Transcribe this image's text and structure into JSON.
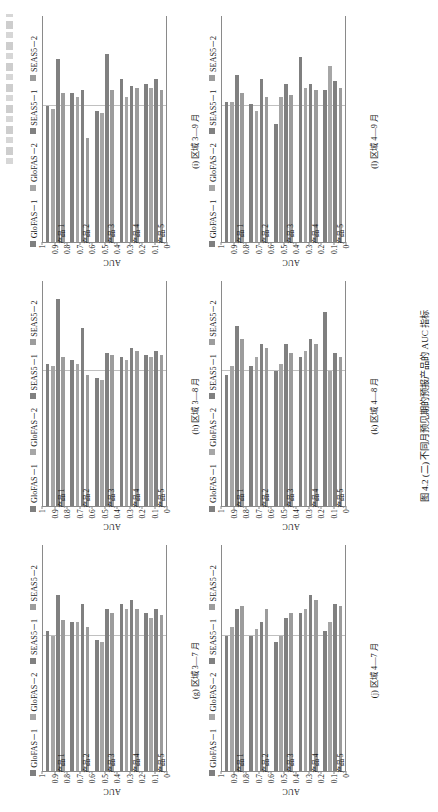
{
  "figure": {
    "caption": "图 4.2 (二)  不同月预见期的预报产品的 AUC 指标"
  },
  "legend": {
    "items": [
      {
        "label": "GloFAS－1",
        "color": "#7f7f7f"
      },
      {
        "label": "GloFAS－2",
        "color": "#a6a6a6"
      },
      {
        "label": "SEAS5－1",
        "color": "#808080"
      },
      {
        "label": "SEAS5－2",
        "color": "#9c9c9c"
      }
    ]
  },
  "axis": {
    "ylabel": "AUC",
    "yticks": [
      "1",
      "0.9",
      "0.8",
      "0.7",
      "0.6",
      "0.5",
      "0.4",
      "0.3",
      "0.2",
      "0.1",
      "0"
    ],
    "categories": [
      "产品 1",
      "产品 2",
      "产品 3",
      "产品 4",
      "产品 5"
    ]
  },
  "chart_data": [
    {
      "type": "bar",
      "id": "g",
      "title": "(g) 区域 3—7 月",
      "categories": [
        "产品 1",
        "产品 2",
        "产品 3",
        "产品 4",
        "产品 5"
      ],
      "series": [
        {
          "name": "GloFAS－1",
          "color": "#7f7f7f",
          "values": [
            0.62,
            0.66,
            0.58,
            0.74,
            0.7
          ]
        },
        {
          "name": "GloFAS－2",
          "color": "#a6a6a6",
          "values": [
            0.6,
            0.66,
            0.57,
            0.72,
            0.68
          ]
        },
        {
          "name": "SEAS5－1",
          "color": "#808080",
          "values": [
            0.78,
            0.74,
            0.72,
            0.76,
            0.72
          ]
        },
        {
          "name": "SEAS5－2",
          "color": "#9c9c9c",
          "values": [
            0.67,
            0.64,
            0.7,
            0.72,
            0.69
          ]
        }
      ],
      "ylabel": "AUC",
      "xlabel": "",
      "ylim": [
        0,
        1
      ],
      "grid": true,
      "legend_position": "top"
    },
    {
      "type": "bar",
      "id": "h",
      "title": "(h) 区域 3—8 月",
      "categories": [
        "产品 1",
        "产品 2",
        "产品 3",
        "产品 4",
        "产品 5"
      ],
      "series": [
        {
          "name": "GloFAS－1",
          "color": "#7f7f7f",
          "values": [
            0.63,
            0.65,
            0.57,
            0.66,
            0.67
          ]
        },
        {
          "name": "GloFAS－2",
          "color": "#a6a6a6",
          "values": [
            0.62,
            0.63,
            0.56,
            0.65,
            0.66
          ]
        },
        {
          "name": "SEAS5－1",
          "color": "#808080",
          "values": [
            0.92,
            0.79,
            0.68,
            0.7,
            0.69
          ]
        },
        {
          "name": "SEAS5－2",
          "color": "#9c9c9c",
          "values": [
            0.66,
            0.58,
            0.67,
            0.69,
            0.67
          ]
        }
      ],
      "ylabel": "AUC",
      "xlabel": "",
      "ylim": [
        0,
        1
      ],
      "grid": true,
      "legend_position": "top"
    },
    {
      "type": "bar",
      "id": "i",
      "title": "(i) 区域 3—9 月",
      "categories": [
        "产品 1",
        "产品 2",
        "产品 3",
        "产品 4",
        "产品 5"
      ],
      "series": [
        {
          "name": "GloFAS－1",
          "color": "#7f7f7f",
          "values": [
            0.6,
            0.66,
            0.58,
            0.72,
            0.7
          ]
        },
        {
          "name": "GloFAS－2",
          "color": "#a6a6a6",
          "values": [
            0.59,
            0.64,
            0.57,
            0.64,
            0.68
          ]
        },
        {
          "name": "SEAS5－1",
          "color": "#808080",
          "values": [
            0.81,
            0.67,
            0.83,
            0.69,
            0.72
          ]
        },
        {
          "name": "SEAS5－2",
          "color": "#9c9c9c",
          "values": [
            0.66,
            0.46,
            0.67,
            0.68,
            0.67
          ]
        }
      ],
      "ylabel": "AUC",
      "xlabel": "",
      "ylim": [
        0,
        1
      ],
      "grid": true,
      "legend_position": "top"
    },
    {
      "type": "bar",
      "id": "j",
      "title": "(j) 区域 4—7 月",
      "categories": [
        "产品 1",
        "产品 2",
        "产品 3",
        "产品 4",
        "产品 5"
      ],
      "series": [
        {
          "name": "GloFAS－1",
          "color": "#7f7f7f",
          "values": [
            0.6,
            0.6,
            0.57,
            0.7,
            0.62
          ]
        },
        {
          "name": "GloFAS－2",
          "color": "#a6a6a6",
          "values": [
            0.64,
            0.63,
            0.6,
            0.72,
            0.66
          ]
        },
        {
          "name": "SEAS5－1",
          "color": "#808080",
          "values": [
            0.72,
            0.66,
            0.68,
            0.78,
            0.74
          ]
        },
        {
          "name": "SEAS5－2",
          "color": "#9c9c9c",
          "values": [
            0.73,
            0.72,
            0.7,
            0.76,
            0.73
          ]
        }
      ],
      "ylabel": "AUC",
      "xlabel": "",
      "ylim": [
        0,
        1
      ],
      "grid": true,
      "legend_position": "top"
    },
    {
      "type": "bar",
      "id": "k",
      "title": "(k) 区域 4—8 月",
      "categories": [
        "产品 1",
        "产品 2",
        "产品 3",
        "产品 4",
        "产品 5"
      ],
      "series": [
        {
          "name": "GloFAS－1",
          "color": "#7f7f7f",
          "values": [
            0.58,
            0.62,
            0.6,
            0.66,
            0.86
          ]
        },
        {
          "name": "GloFAS－2",
          "color": "#a6a6a6",
          "values": [
            0.62,
            0.66,
            0.63,
            0.69,
            0.6
          ]
        },
        {
          "name": "SEAS5－1",
          "color": "#808080",
          "values": [
            0.8,
            0.72,
            0.72,
            0.74,
            0.68
          ]
        },
        {
          "name": "SEAS5－2",
          "color": "#9c9c9c",
          "values": [
            0.74,
            0.7,
            0.68,
            0.72,
            0.66
          ]
        }
      ],
      "ylabel": "AUC",
      "xlabel": "",
      "ylim": [
        0,
        1
      ],
      "grid": true,
      "legend_position": "top"
    },
    {
      "type": "bar",
      "id": "l",
      "title": "(l) 区域 4—9 月",
      "categories": [
        "产品 1",
        "产品 2",
        "产品 3",
        "产品 4",
        "产品 5"
      ],
      "series": [
        {
          "name": "GloFAS－1",
          "color": "#7f7f7f",
          "values": [
            0.62,
            0.61,
            0.52,
            0.82,
            0.67
          ]
        },
        {
          "name": "GloFAS－2",
          "color": "#a6a6a6",
          "values": [
            0.62,
            0.58,
            0.64,
            0.68,
            0.78
          ]
        },
        {
          "name": "SEAS5－1",
          "color": "#808080",
          "values": [
            0.74,
            0.72,
            0.7,
            0.7,
            0.71
          ]
        },
        {
          "name": "SEAS5－2",
          "color": "#9c9c9c",
          "values": [
            0.66,
            0.64,
            0.65,
            0.67,
            0.68
          ]
        }
      ],
      "ylabel": "AUC",
      "xlabel": "",
      "ylim": [
        0,
        1
      ],
      "grid": true,
      "legend_position": "top"
    }
  ]
}
